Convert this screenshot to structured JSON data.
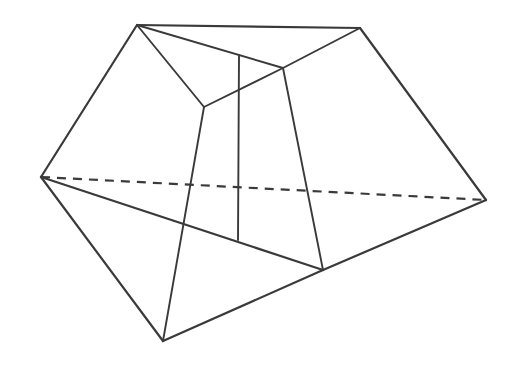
{
  "figure": {
    "kind": "polyhedron-line-drawing",
    "canvas": {
      "width": 518,
      "height": 366
    },
    "colors": {
      "background": "#ffffff",
      "stroke": "#3a3a3a"
    },
    "stroke_widths": {
      "outline": 2.2,
      "interior": 1.9,
      "hidden": 2.2
    },
    "hidden_edge_dash": "9 7",
    "vertices": {
      "top_left": {
        "label": "A",
        "x": 137,
        "y": 25
      },
      "top_right": {
        "label": "B",
        "x": 360,
        "y": 28
      },
      "right": {
        "label": "C",
        "x": 486,
        "y": 200
      },
      "lower_right": {
        "label": "D",
        "x": 323,
        "y": 270
      },
      "bottom": {
        "label": "E",
        "x": 163,
        "y": 341
      },
      "left": {
        "label": "F",
        "x": 41,
        "y": 177
      },
      "inner_left": {
        "label": "G",
        "x": 204,
        "y": 107
      },
      "inner_right": {
        "label": "H",
        "x": 283,
        "y": 68
      },
      "center_top": {
        "label": "I",
        "x": 239,
        "y": 55
      },
      "center_bottom": {
        "label": "J",
        "x": 238,
        "y": 240
      }
    },
    "edges": [
      {
        "name": "outline-top",
        "from": "top_left",
        "to": "top_right",
        "style": "solid"
      },
      {
        "name": "outline-top-right",
        "from": "top_right",
        "to": "right",
        "style": "solid"
      },
      {
        "name": "outline-right-lower",
        "from": "right",
        "to": "lower_right",
        "style": "solid"
      },
      {
        "name": "outline-lower-bottom",
        "from": "lower_right",
        "to": "bottom",
        "style": "solid"
      },
      {
        "name": "outline-bottom-left",
        "from": "bottom",
        "to": "left",
        "style": "solid"
      },
      {
        "name": "outline-left-top",
        "from": "left",
        "to": "top_left",
        "style": "solid"
      },
      {
        "name": "hidden-diagonal",
        "from": "left",
        "to": "right",
        "style": "dashed"
      },
      {
        "name": "front-diagonal",
        "from": "left",
        "to": "lower_right",
        "style": "solid"
      },
      {
        "name": "top-face-left",
        "from": "top_left",
        "to": "inner_left",
        "style": "solid"
      },
      {
        "name": "top-face-ridge",
        "from": "top_left",
        "to": "inner_right",
        "style": "solid"
      },
      {
        "name": "top-face-right",
        "from": "top_right",
        "to": "inner_right",
        "style": "solid"
      },
      {
        "name": "top-face-inner",
        "from": "inner_left",
        "to": "inner_right",
        "style": "solid"
      },
      {
        "name": "left-pillar",
        "from": "inner_left",
        "to": "bottom",
        "style": "solid"
      },
      {
        "name": "right-pillar",
        "from": "inner_right",
        "to": "lower_right",
        "style": "solid"
      },
      {
        "name": "center-vertical",
        "from": "center_top",
        "to": "center_bottom",
        "style": "solid"
      }
    ]
  }
}
